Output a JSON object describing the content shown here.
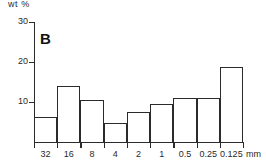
{
  "figure": {
    "panel_label": "B",
    "y_axis_title": "wt %",
    "x_unit": "mm"
  },
  "chart_data": {
    "type": "bar",
    "title": "B",
    "xlabel": "mm",
    "ylabel": "wt %",
    "categories": [
      "32",
      "16",
      "8",
      "4",
      "2",
      "1",
      "0.5",
      "0.25",
      "0.125"
    ],
    "values": [
      6.3,
      14.0,
      10.5,
      4.8,
      7.5,
      9.5,
      11.0,
      11.0,
      18.8
    ],
    "ylim": [
      0,
      30
    ],
    "yticks": [
      10,
      20,
      30
    ],
    "ytick_labels": [
      "10",
      "20",
      "30"
    ],
    "xtick_labels": [
      "32",
      "16",
      "8",
      "4",
      "2",
      "1",
      "0.5",
      "0.25",
      "0.125"
    ],
    "grid": false,
    "legend": null,
    "bar_style": "outline",
    "axis_direction": "decreasing grain size left to right"
  }
}
